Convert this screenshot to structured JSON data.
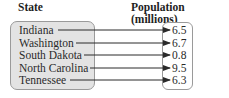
{
  "headers": {
    "domain": "State",
    "range": "Population (millions)"
  },
  "mapping": [
    {
      "state": "Indiana",
      "population": "6.5"
    },
    {
      "state": "Washington",
      "population": "6.7"
    },
    {
      "state": "South Dakota",
      "population": "0.8"
    },
    {
      "state": "North Carolina",
      "population": "9.5"
    },
    {
      "state": "Tennessee",
      "population": "6.3"
    }
  ],
  "colors": {
    "domain_fill": "#e3e3e3",
    "border": "#9a9a9a",
    "arrow": "#2a2a2a"
  }
}
